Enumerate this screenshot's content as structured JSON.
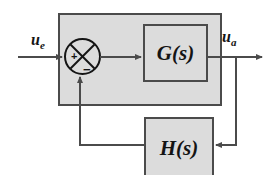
{
  "diagram": {
    "background_color": "#ffffff",
    "block_fill_color": "#dcdcdc",
    "line_color": "#4b4b4b",
    "text_color": "#141414",
    "blocks": {
      "forward_block": {
        "label": "G(s)",
        "name": "forward-transfer-function"
      },
      "feedback_block": {
        "label": "H(s)",
        "name": "feedback-transfer-function"
      },
      "plant_container": {
        "label": ""
      }
    },
    "summing_junction": {
      "positive_sign": "+",
      "negative_sign": "−"
    },
    "signals": {
      "input_label": "u",
      "input_subscript": "e",
      "output_label": "u",
      "output_subscript": "a"
    }
  }
}
